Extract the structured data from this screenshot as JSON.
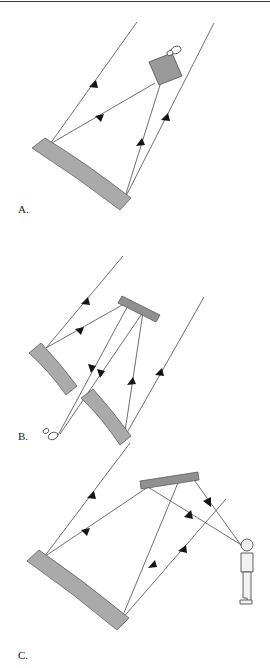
{
  "figure": {
    "background_color": "#ffffff",
    "line_color": "#4a4a4a",
    "mirror_fill": "#aaaaaa",
    "mirror_stroke": "#5d5d5d",
    "flat_mirror_fill": "#909090",
    "arrow_color": "#151515",
    "panel_count": 3
  },
  "panels": [
    {
      "id": "panel-a",
      "label": "A.",
      "label_x": 18,
      "label_y": 213,
      "description": "Prime focus configuration: incoming parallel rays reflect off a curved concave primary mirror to a camera at the prime focus.",
      "components": {
        "primary_mirror": "curved concave mirror, lower left, tilted about 45 degrees",
        "detector": "camera box at prime focus with small eyepiece circles",
        "incoming_rays": 2,
        "reflected_rays": 2
      }
    },
    {
      "id": "panel-b",
      "label": "B.",
      "label_x": 18,
      "label_y": 440,
      "description": "Newtonian / segmented configuration: two curved primary mirror segments reflect light to a flat secondary mirror, which directs the beam down to an eyepiece at lower left.",
      "components": {
        "primary_mirror_segments": 2,
        "secondary_mirror": "flat tilted mirror, upper middle",
        "detector": "small eyepiece at lower left",
        "incoming_rays": 2,
        "reflected_rays": 4
      }
    },
    {
      "id": "panel-c",
      "label": "C.",
      "label_x": 18,
      "label_y": 659,
      "description": "Cassegrain-style visual configuration: a curved primary mirror reflects light to a near-horizontal flat secondary mirror, which folds the beam to a human observer standing at right.",
      "components": {
        "primary_mirror": "curved concave mirror, lower left",
        "secondary_mirror": "flat near-horizontal mirror, upper middle",
        "observer": "standing human figure at right",
        "incoming_rays": 2,
        "reflected_rays": 4
      }
    }
  ],
  "geometry": {
    "panel_a": {
      "primary_mirror_path": "M 32,148 L 45,138 L 131,198 L 120,210 Z",
      "primary_top_curve": "M 45,138 Q 86,163 131,198",
      "primary_bottom_curve": "M 32,148 Q 78,176 120,210",
      "camera_box": "M 150,60 L 173,54 L 180,77 L 157,84 Z",
      "rays": [
        {
          "from": [
            137,
            22
          ],
          "to": [
            50,
            144
          ],
          "arrow_at": 0.46
        },
        {
          "from": [
            214,
            23
          ],
          "to": [
            124,
            200
          ],
          "arrow_at": 0.52
        },
        {
          "from": [
            50,
            144
          ],
          "to": [
            155,
            83
          ],
          "arrow_at": 0.57
        },
        {
          "from": [
            124,
            200
          ],
          "to": [
            160,
            85
          ],
          "arrow_at": 0.56
        }
      ]
    },
    "panel_b": {
      "primary_upper_path": "M 30,352 L 42,343 L 76,385 L 66,394 Z",
      "primary_lower_path": "M 82,397 L 93,389 L 130,435 L 120,444 Z",
      "secondary_flat": "M 123,297 L 160,316 L 156,322 L 119,303 Z",
      "rays": [
        {
          "from": [
            123,
            256
          ],
          "to": [
            46,
            348
          ],
          "arrow_at": 0.45
        },
        {
          "from": [
            204,
            297
          ],
          "to": [
            124,
            438
          ],
          "arrow_at": 0.52
        },
        {
          "from": [
            46,
            348
          ],
          "to": [
            131,
            300
          ],
          "arrow_at": 0.56
        },
        {
          "from": [
            124,
            438
          ],
          "to": [
            143,
            312
          ],
          "arrow_at": 0.52
        },
        {
          "from": [
            131,
            300
          ],
          "to": [
            61,
            433
          ],
          "arrow_at": 0.52
        },
        {
          "from": [
            143,
            312
          ],
          "to": [
            63,
            430
          ],
          "arrow_at": 0.48
        }
      ],
      "eyepiece_center": [
        50,
        434
      ]
    },
    "panel_c": {
      "primary_mirror_path": "M 28,560 L 40,551 L 128,618 L 117,629 Z",
      "secondary_flat": "M 141,482 L 197,473 L 198,480 L 142,489 Z",
      "rays": [
        {
          "from": [
            130,
            443
          ],
          "to": [
            44,
            557
          ],
          "arrow_at": 0.46
        },
        {
          "from": [
            226,
            499
          ],
          "to": [
            121,
            620
          ],
          "arrow_at": 0.52
        },
        {
          "from": [
            44,
            557
          ],
          "to": [
            148,
            487
          ],
          "arrow_at": 0.56
        },
        {
          "from": [
            121,
            620
          ],
          "to": [
            178,
            479
          ],
          "arrow_at": 0.52
        },
        {
          "from": [
            148,
            487
          ],
          "to": [
            243,
            546
          ],
          "arrow_at": 0.52
        },
        {
          "from": [
            190,
            477
          ],
          "to": [
            243,
            548
          ],
          "arrow_at": 0.48
        }
      ],
      "person_position": [
        243,
        546
      ]
    }
  }
}
